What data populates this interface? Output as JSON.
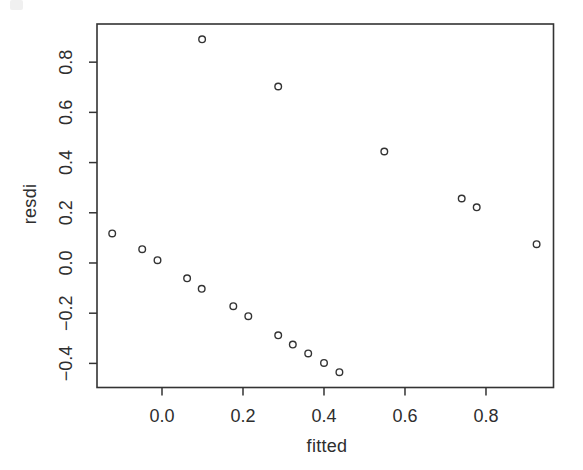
{
  "figure": {
    "kind": "scanned R base-graphics scatter plot",
    "background": "#ffffff"
  },
  "colors": {
    "axis": "#333333",
    "tick_text": "#2e2e2e",
    "marker_stroke": "#333333",
    "background": "#ffffff"
  },
  "chart_data": {
    "type": "scatter",
    "title": "",
    "xlabel": "fitted",
    "ylabel": "resdi",
    "xlim": [
      -0.1605,
      0.9667
    ],
    "ylim": [
      -0.496,
      0.952
    ],
    "x_ticks": [
      0.0,
      0.2,
      0.4,
      0.6,
      0.8
    ],
    "x_tick_labels": [
      "0.0",
      "0.2",
      "0.4",
      "0.6",
      "0.8"
    ],
    "y_ticks": [
      -0.4,
      -0.2,
      0.0,
      0.2,
      0.4,
      0.6,
      0.8
    ],
    "y_tick_labels": [
      "−0.4",
      "−0.2",
      "0.0",
      "0.2",
      "0.4",
      "0.6",
      "0.8"
    ],
    "grid": false,
    "legend": null,
    "marker": "open-circle",
    "marker_radius_px": 3.3,
    "points": [
      {
        "fitted": -0.123,
        "resdi": 0.118
      },
      {
        "fitted": -0.049,
        "resdi": 0.055
      },
      {
        "fitted": -0.011,
        "resdi": 0.011
      },
      {
        "fitted": 0.062,
        "resdi": -0.061
      },
      {
        "fitted": 0.098,
        "resdi": -0.103
      },
      {
        "fitted": 0.176,
        "resdi": -0.172
      },
      {
        "fitted": 0.213,
        "resdi": -0.212
      },
      {
        "fitted": 0.287,
        "resdi": -0.288
      },
      {
        "fitted": 0.323,
        "resdi": -0.325
      },
      {
        "fitted": 0.361,
        "resdi": -0.36
      },
      {
        "fitted": 0.4,
        "resdi": -0.398
      },
      {
        "fitted": 0.438,
        "resdi": -0.435
      },
      {
        "fitted": 0.099,
        "resdi": 0.891
      },
      {
        "fitted": 0.287,
        "resdi": 0.703
      },
      {
        "fitted": 0.549,
        "resdi": 0.444
      },
      {
        "fitted": 0.74,
        "resdi": 0.257
      },
      {
        "fitted": 0.777,
        "resdi": 0.222
      },
      {
        "fitted": 0.925,
        "resdi": 0.075
      }
    ]
  }
}
